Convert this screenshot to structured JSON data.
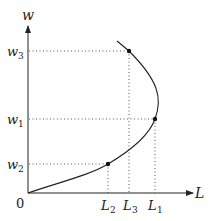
{
  "diagram": {
    "y_axis_label": "w",
    "x_axis_label": "L",
    "origin_label": "0",
    "y_ticks": [
      {
        "name": "w",
        "sub": "3",
        "y": 51
      },
      {
        "name": "w",
        "sub": "1",
        "y": 119
      },
      {
        "name": "w",
        "sub": "2",
        "y": 164
      }
    ],
    "x_ticks": [
      {
        "name": "L",
        "sub": "2",
        "x": 108
      },
      {
        "name": "L",
        "sub": "3",
        "x": 130
      },
      {
        "name": "L",
        "sub": "1",
        "x": 155
      }
    ],
    "points": [
      {
        "label": "(L3, w3)",
        "x": 129,
        "y": 51
      },
      {
        "label": "(L1, w1)",
        "x": 155,
        "y": 119
      },
      {
        "label": "(L2, w2)",
        "x": 108,
        "y": 164
      }
    ],
    "curve": "backward-bending labor supply curve",
    "colors": {
      "line": "#222222",
      "dotted": "#555555"
    }
  }
}
